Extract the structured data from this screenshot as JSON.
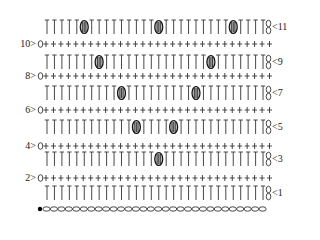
{
  "diagram": {
    "type": "crochet-stitch-chart",
    "stitch_count": 30,
    "row_count": 11,
    "foundation": {
      "type": "chain",
      "count": 30,
      "start_marker": "slip-knot-dot"
    },
    "colors": {
      "ink": "#333333",
      "bobble_fill": "#555555",
      "background": "#ffffff"
    },
    "stitch_legend": {
      "T": "double crochet (dc)",
      "+": "single crochet (sc)",
      "bobble": "bobble stitch",
      "0": "chain (turning)",
      "8": "two chains (turning)"
    },
    "rows": [
      {
        "number": 1,
        "label": "<1",
        "side": "right",
        "stitch": "T",
        "turning": "8",
        "bobbles": []
      },
      {
        "number": 2,
        "label": "2>",
        "side": "left",
        "stitch": "+",
        "turning": "0",
        "bobbles": []
      },
      {
        "number": 3,
        "label": "<3",
        "side": "right",
        "stitch": "T",
        "turning": "8",
        "bobbles": [
          15
        ]
      },
      {
        "number": 4,
        "label": "4>",
        "side": "left",
        "stitch": "+",
        "turning": "0",
        "bobbles": []
      },
      {
        "number": 5,
        "label": "<5",
        "side": "right",
        "stitch": "T",
        "turning": "8",
        "bobbles": [
          12,
          17
        ]
      },
      {
        "number": 6,
        "label": "6>",
        "side": "left",
        "stitch": "+",
        "turning": "0",
        "bobbles": []
      },
      {
        "number": 7,
        "label": "<7",
        "side": "right",
        "stitch": "T",
        "turning": "8",
        "bobbles": [
          10,
          20
        ]
      },
      {
        "number": 8,
        "label": "8>",
        "side": "left",
        "stitch": "+",
        "turning": "0",
        "bobbles": []
      },
      {
        "number": 9,
        "label": "<9",
        "side": "right",
        "stitch": "T",
        "turning": "8",
        "bobbles": [
          7,
          22
        ]
      },
      {
        "number": 10,
        "label": "10>",
        "side": "left",
        "stitch": "+",
        "turning": "0",
        "bobbles": []
      },
      {
        "number": 11,
        "label": "<11",
        "side": "right",
        "stitch": "T",
        "turning": "8",
        "bobbles": [
          5,
          15,
          25
        ]
      }
    ]
  }
}
